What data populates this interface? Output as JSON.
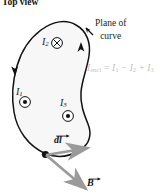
{
  "figure": {
    "title": "Top view",
    "annotation_plane": "Plane of\ncurve",
    "annotation_plane_line1": "Plane of",
    "annotation_plane_line2": "curve",
    "equation": {
      "lhs_symbol": "I",
      "lhs_subscript": "encl",
      "full_text": "I_encl = I_1 - I_2 + I_3",
      "terms": [
        {
          "sign": "",
          "symbol": "I",
          "subscript": "1"
        },
        {
          "sign": "−",
          "symbol": "I",
          "subscript": "2"
        },
        {
          "sign": "+",
          "symbol": "I",
          "subscript": "3"
        }
      ],
      "color": "#bfbfbf"
    },
    "currents": [
      {
        "label": "I",
        "subscript": "1",
        "direction": "out-of-page",
        "marker": "circle-dot",
        "x": 16,
        "y": 86
      },
      {
        "label": "I",
        "subscript": "2",
        "direction": "into-page",
        "marker": "circle-cross",
        "x": 42,
        "y": 36
      },
      {
        "label": "I",
        "subscript": "3",
        "direction": "out-of-page",
        "marker": "circle-dot",
        "x": 60,
        "y": 97
      }
    ],
    "vectors": [
      {
        "label": "dl",
        "symbol": "dl",
        "kind": "line-element",
        "color": "#999999"
      },
      {
        "label": "B",
        "symbol": "B",
        "kind": "magnetic-field",
        "color": "#8c8c8c"
      }
    ],
    "loop": {
      "description": "closed integration path (Amperian loop)",
      "fill_color": "#f7f7f7",
      "stroke_color": "#111111",
      "direction": "counterclockwise"
    },
    "colors": {
      "ink": "#111111",
      "loop_fill": "#f7f7f7",
      "equation_gray": "#bfbfbf",
      "vector_gray": "#8c8c8c"
    }
  }
}
